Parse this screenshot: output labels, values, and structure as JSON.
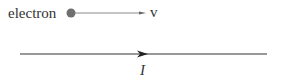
{
  "diagram": {
    "electron_label": "electron",
    "velocity_label": "v",
    "current_label": "I",
    "colors": {
      "dot": "#707070",
      "velocity_line": "#808080",
      "wire": "#333333",
      "text": "#333333"
    }
  }
}
